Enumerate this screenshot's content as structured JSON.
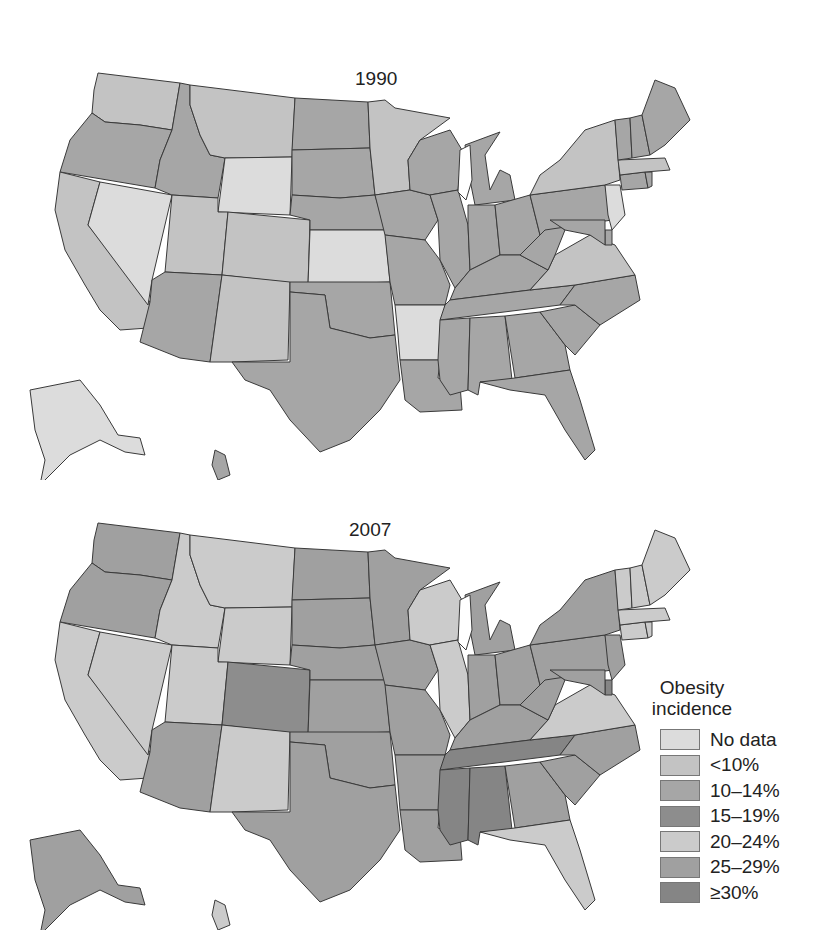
{
  "figure": {
    "maps": [
      {
        "id": "1990",
        "title": "1990"
      },
      {
        "id": "2007",
        "title": "2007"
      }
    ]
  },
  "legend": {
    "title_line1": "Obesity",
    "title_line2": "incidence",
    "items": [
      {
        "label": "No data",
        "color": "#dcdcdc"
      },
      {
        "label": "<10%",
        "color": "#c3c3c3"
      },
      {
        "label": "10–14%",
        "color": "#a6a6a6"
      },
      {
        "label": "15–19%",
        "color": "#8d8d8d"
      },
      {
        "label": "20–24%",
        "color": "#cbcbcb"
      },
      {
        "label": "25–29%",
        "color": "#a0a0a0"
      },
      {
        "label": "≥30%",
        "color": "#858585"
      }
    ]
  },
  "chart_data": {
    "type": "choropleth",
    "panels": [
      "1990",
      "2007"
    ],
    "categories": [
      "No data",
      "<10%",
      "10–14%",
      "15–19%",
      "20–24%",
      "25–29%",
      "≥30%"
    ],
    "values": {
      "1990": {
        "WA": "<10%",
        "OR": "10–14%",
        "CA": "<10%",
        "NV": "No data",
        "ID": "10–14%",
        "MT": "<10%",
        "WY": "No data",
        "UT": "<10%",
        "CO": "<10%",
        "AZ": "10–14%",
        "NM": "<10%",
        "ND": "10–14%",
        "SD": "10–14%",
        "NE": "10–14%",
        "KS": "No data",
        "OK": "10–14%",
        "TX": "10–14%",
        "MN": "<10%",
        "IA": "10–14%",
        "MO": "10–14%",
        "AR": "No data",
        "LA": "10–14%",
        "WI": "10–14%",
        "IL": "10–14%",
        "MI": "10–14%",
        "IN": "10–14%",
        "OH": "10–14%",
        "KY": "10–14%",
        "TN": "10–14%",
        "MS": "10–14%",
        "AL": "10–14%",
        "GA": "10–14%",
        "FL": "10–14%",
        "SC": "10–14%",
        "NC": "10–14%",
        "VA": "<10%",
        "WV": "10–14%",
        "PA": "10–14%",
        "NY": "<10%",
        "NJ": "No data",
        "DE": "10–14%",
        "MD": "10–14%",
        "CT": "10–14%",
        "RI": "10–14%",
        "MA": "<10%",
        "VT": "10–14%",
        "NH": "10–14%",
        "ME": "10–14%",
        "AK": "No data",
        "HI": "10–14%"
      },
      "2007": {
        "WA": "25–29%",
        "OR": "25–29%",
        "CA": "20–24%",
        "NV": "20–24%",
        "ID": "20–24%",
        "MT": "20–24%",
        "WY": "20–24%",
        "UT": "20–24%",
        "CO": "15–19%",
        "AZ": "25–29%",
        "NM": "20–24%",
        "ND": "25–29%",
        "SD": "25–29%",
        "NE": "25–29%",
        "KS": "25–29%",
        "OK": "25–29%",
        "TX": "25–29%",
        "MN": "25–29%",
        "IA": "25–29%",
        "MO": "25–29%",
        "AR": "25–29%",
        "LA": "25–29%",
        "WI": "20–24%",
        "IL": "20–24%",
        "MI": "25–29%",
        "IN": "25–29%",
        "OH": "25–29%",
        "KY": "25–29%",
        "TN": "≥30%",
        "MS": "≥30%",
        "AL": "≥30%",
        "GA": "25–29%",
        "FL": "20–24%",
        "SC": "25–29%",
        "NC": "25–29%",
        "VA": "20–24%",
        "WV": "25–29%",
        "PA": "25–29%",
        "NY": "25–29%",
        "NJ": "25–29%",
        "DE": "≥30%",
        "MD": "25–29%",
        "CT": "20–24%",
        "RI": "20–24%",
        "MA": "20–24%",
        "VT": "20–24%",
        "NH": "20–24%",
        "ME": "20–24%",
        "AK": "25–29%",
        "HI": "20–24%"
      }
    },
    "legend_position": "right"
  }
}
